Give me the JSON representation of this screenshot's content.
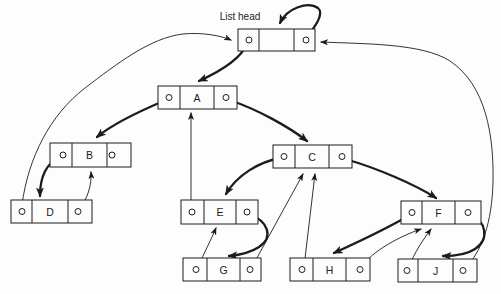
{
  "figure": {
    "head_label": {
      "text": "List head"
    },
    "ink": "#1c1c1c",
    "background": "#fdfdfd",
    "nodes": [
      {
        "id": "head",
        "label": "",
        "x": 238,
        "y": 29,
        "w": 77,
        "h": 22,
        "d1": 259,
        "d2": 294,
        "lc": 249,
        "rc": 306
      },
      {
        "id": "A",
        "label": "A",
        "x": 158,
        "y": 86,
        "w": 79,
        "h": 23,
        "d1": 180,
        "d2": 214,
        "lc": 169,
        "rc": 226
      },
      {
        "id": "B",
        "label": "B",
        "x": 50,
        "y": 143,
        "w": 81,
        "h": 24,
        "d1": 72,
        "d2": 107,
        "lc": 63,
        "rc": 112
      },
      {
        "id": "C",
        "label": "C",
        "x": 273,
        "y": 145,
        "w": 79,
        "h": 23,
        "d1": 295,
        "d2": 329,
        "lc": 284,
        "rc": 342
      },
      {
        "id": "D",
        "label": "D",
        "x": 11,
        "y": 200,
        "w": 81,
        "h": 23,
        "d1": 32,
        "d2": 68,
        "lc": 22,
        "rc": 78
      },
      {
        "id": "E",
        "label": "E",
        "x": 181,
        "y": 200,
        "w": 77,
        "h": 24,
        "d1": 204,
        "d2": 236,
        "lc": 192,
        "rc": 247
      },
      {
        "id": "F",
        "label": "F",
        "x": 401,
        "y": 201,
        "w": 80,
        "h": 23,
        "d1": 422,
        "d2": 455,
        "lc": 412,
        "rc": 468
      },
      {
        "id": "G",
        "label": "G",
        "x": 183,
        "y": 258,
        "w": 78,
        "h": 23,
        "d1": 207,
        "d2": 240,
        "lc": 196,
        "rc": 250
      },
      {
        "id": "H",
        "label": "H",
        "x": 290,
        "y": 258,
        "w": 80,
        "h": 23,
        "d1": 313,
        "d2": 346,
        "lc": 302,
        "rc": 360
      },
      {
        "id": "J",
        "label": "J",
        "x": 398,
        "y": 259,
        "w": 79,
        "h": 23,
        "d1": 418,
        "d2": 453,
        "lc": 407,
        "rc": 463
      }
    ],
    "links": [
      {
        "name": "head-rlink-self-loop",
        "from": "head",
        "to": "head",
        "weight": "thick",
        "path": "M 306,38 C 314,28 325,14 318,8 C 308,1 287,8 280,23"
      },
      {
        "name": "head-llink-to-a",
        "from": "head",
        "to": "A",
        "weight": "thick",
        "path": "M 247,44 C 241,58 221,71 199,81"
      },
      {
        "name": "a-llink-to-b",
        "from": "A",
        "to": "B",
        "weight": "thick",
        "path": "M 166,100 C 147,108 115,122 97,137"
      },
      {
        "name": "a-rlink-to-c",
        "from": "A",
        "to": "C",
        "weight": "thick",
        "path": "M 229,100 C 257,109 289,127 307,141"
      },
      {
        "name": "b-llink-to-d",
        "from": "B",
        "to": "D",
        "weight": "thick",
        "path": "M 60,157 C 47,163 40,176 40,196"
      },
      {
        "name": "c-llink-to-e",
        "from": "C",
        "to": "E",
        "weight": "thick",
        "path": "M 280,158 C 259,162 237,175 226,194"
      },
      {
        "name": "c-rlink-to-f",
        "from": "C",
        "to": "F",
        "weight": "thick",
        "path": "M 345,159 C 377,168 416,185 436,198"
      },
      {
        "name": "e-rlink-to-g",
        "from": "E",
        "to": "G",
        "weight": "thick",
        "path": "M 249,214 C 268,221 274,237 259,247 C 250,253 239,255 229,256"
      },
      {
        "name": "f-llink-to-h",
        "from": "F",
        "to": "H",
        "weight": "thick",
        "path": "M 410,215 C 386,229 356,243 334,253"
      },
      {
        "name": "f-rlink-to-j",
        "from": "F",
        "to": "J",
        "weight": "thick",
        "path": "M 470,214 C 486,221 490,239 475,249 C 466,255 453,256 443,256"
      },
      {
        "name": "d-llink-to-head",
        "from": "D",
        "to": "head",
        "weight": "thin",
        "path": "M 22,205 C 28,158 50,115 85,88 C 118,63 150,38 183,34 C 203,32 222,36 231,40"
      },
      {
        "name": "d-rlink-to-b",
        "from": "D",
        "to": "B",
        "weight": "thin",
        "path": "M 80,208 C 87,199 92,186 91,172"
      },
      {
        "name": "e-llink-to-a",
        "from": "E",
        "to": "A",
        "weight": "thin",
        "path": "M 191,209 L 191,113"
      },
      {
        "name": "g-llink-to-e",
        "from": "G",
        "to": "E",
        "weight": "thin",
        "path": "M 198,267 C 204,253 211,240 216,228"
      },
      {
        "name": "g-rlink-to-c",
        "from": "G",
        "to": "C",
        "weight": "thin",
        "path": "M 252,267 L 303,174"
      },
      {
        "name": "h-llink-to-c",
        "from": "H",
        "to": "C",
        "weight": "thin",
        "path": "M 304,267 L 315,174"
      },
      {
        "name": "h-rlink-to-f",
        "from": "H",
        "to": "F",
        "weight": "thin",
        "path": "M 362,266 C 373,251 398,237 421,229"
      },
      {
        "name": "j-llink-to-f",
        "from": "J",
        "to": "F",
        "weight": "thin",
        "path": "M 409,267 C 414,253 423,240 431,229"
      },
      {
        "name": "j-rlink-to-head",
        "from": "J",
        "to": "head",
        "weight": "thin",
        "path": "M 465,268 C 482,252 492,222 493,182 C 494,136 486,85 450,61 C 422,43 364,44 321,42"
      }
    ]
  }
}
